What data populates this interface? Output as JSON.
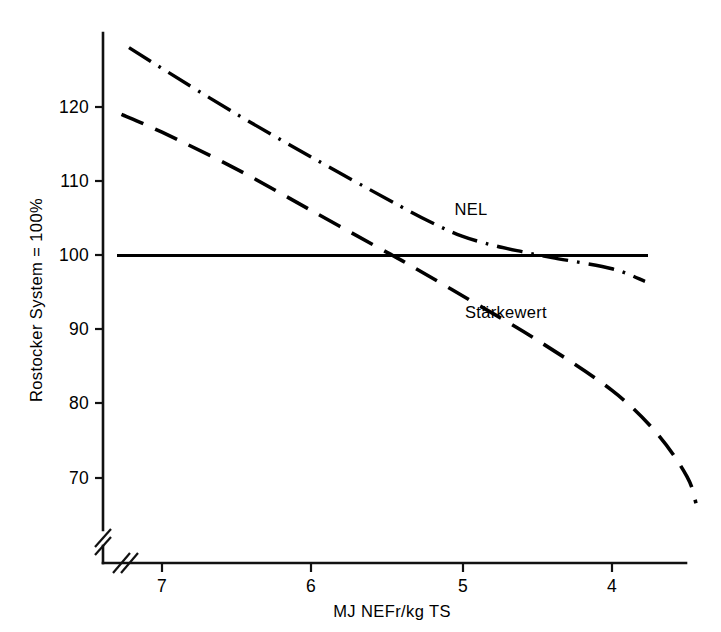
{
  "chart_data": {
    "type": "line",
    "title": "",
    "xlabel": "MJ NEFr/kg TS",
    "ylabel": "Rostocker System = 100%",
    "x_ticks": [
      "7",
      "6",
      "5",
      "4"
    ],
    "x_tick_values": [
      7,
      6,
      5,
      4
    ],
    "y_ticks": [
      "120",
      "110",
      "100",
      "90",
      "80",
      "70"
    ],
    "y_tick_values": [
      120,
      110,
      100,
      90,
      80,
      70
    ],
    "xlim": [
      7.4,
      3.5
    ],
    "ylim": [
      62,
      130
    ],
    "x_axis_inverted": true,
    "grid": false,
    "axis_break": "double-slash at origin on both axes",
    "legend": "inline series labels",
    "series": [
      {
        "name": "NEL",
        "style": "dash-dot",
        "label_x": 5.05,
        "label_y": 105.5,
        "points": [
          {
            "x": 7.22,
            "y": 128.0
          },
          {
            "x": 7.0,
            "y": 125.2
          },
          {
            "x": 6.5,
            "y": 119.0
          },
          {
            "x": 6.0,
            "y": 113.2
          },
          {
            "x": 5.5,
            "y": 107.6
          },
          {
            "x": 5.2,
            "y": 104.4
          },
          {
            "x": 5.0,
            "y": 102.6
          },
          {
            "x": 4.8,
            "y": 101.4
          },
          {
            "x": 4.6,
            "y": 100.5
          },
          {
            "x": 4.4,
            "y": 99.7
          },
          {
            "x": 4.0,
            "y": 98.2
          },
          {
            "x": 3.78,
            "y": 96.5
          }
        ]
      },
      {
        "name": "Stärkewert",
        "style": "dashed",
        "label_x": 4.98,
        "label_y": 91.5,
        "points": [
          {
            "x": 7.27,
            "y": 119.0
          },
          {
            "x": 7.0,
            "y": 116.6
          },
          {
            "x": 6.5,
            "y": 111.6
          },
          {
            "x": 6.0,
            "y": 106.0
          },
          {
            "x": 5.5,
            "y": 100.4
          },
          {
            "x": 5.4,
            "y": 99.3
          },
          {
            "x": 5.0,
            "y": 94.6
          },
          {
            "x": 4.5,
            "y": 88.6
          },
          {
            "x": 4.0,
            "y": 81.8
          },
          {
            "x": 3.7,
            "y": 76.0
          },
          {
            "x": 3.5,
            "y": 70.2
          },
          {
            "x": 3.44,
            "y": 66.6
          }
        ]
      },
      {
        "name": "Reference 100%",
        "style": "solid",
        "constant_value": 100,
        "points": [
          {
            "x": 7.3,
            "y": 100
          },
          {
            "x": 3.76,
            "y": 100
          }
        ]
      }
    ]
  },
  "axes": {
    "y_title": "Rostocker System = 100%",
    "x_title": "MJ NEFr/kg TS"
  },
  "labels": {
    "nel": "NEL",
    "staerkewert": "Stärkewert"
  }
}
